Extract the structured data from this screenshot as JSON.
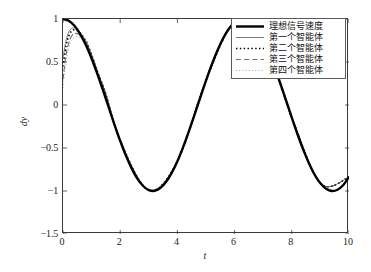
{
  "chart_data": {
    "type": "line",
    "title": "",
    "xlabel": "t",
    "ylabel": "dy",
    "xlim": [
      0,
      10
    ],
    "ylim": [
      -1.5,
      1
    ],
    "xticks": [
      "0",
      "2",
      "4",
      "6",
      "8",
      "10"
    ],
    "xtick_values": [
      0,
      2,
      4,
      6,
      8,
      10
    ],
    "yticks": [
      "1",
      "0.5",
      "0",
      "-0.5",
      "-1",
      "-1.5"
    ],
    "ytick_values": [
      1,
      0.5,
      0,
      -0.5,
      -1,
      -1.5
    ],
    "grid": false,
    "legend_position": "top-right",
    "series": [
      {
        "name": "理想信号速度",
        "style": "solid",
        "width": 2.4,
        "color": "#000000",
        "x": [
          0,
          0.2,
          0.4,
          0.6,
          0.8,
          1,
          1.2,
          1.4,
          1.6,
          1.8,
          2,
          2.2,
          2.4,
          2.6,
          2.8,
          3,
          3.2,
          3.4,
          3.6,
          3.8,
          4,
          4.2,
          4.4,
          4.6,
          4.8,
          5,
          5.2,
          5.4,
          5.6,
          5.8,
          6,
          6.2,
          6.4,
          6.6,
          6.8,
          7,
          7.2,
          7.4,
          7.6,
          7.8,
          8,
          8.2,
          8.4,
          8.6,
          8.8,
          9,
          9.2,
          9.4,
          9.6,
          9.8,
          10
        ],
        "y": [
          1,
          0.98,
          0.921,
          0.825,
          0.697,
          0.54,
          0.362,
          0.17,
          -0.029,
          -0.227,
          -0.416,
          -0.589,
          -0.737,
          -0.857,
          -0.942,
          -0.99,
          -0.998,
          -0.967,
          -0.897,
          -0.791,
          -0.654,
          -0.49,
          -0.307,
          -0.112,
          0.087,
          0.284,
          0.469,
          0.635,
          0.776,
          0.886,
          0.96,
          0.997,
          0.993,
          0.95,
          0.869,
          0.754,
          0.608,
          0.438,
          0.251,
          0.055,
          -0.146,
          -0.34,
          -0.519,
          -0.677,
          -0.811,
          -0.911,
          -0.975,
          -1,
          -0.985,
          -0.93,
          -0.839
        ]
      },
      {
        "name": "第一个智能体",
        "style": "thin-solid",
        "width": 0.8,
        "color": "#5a5a5a",
        "initial_value": 0.55,
        "x": [
          0,
          0.1,
          0.2,
          0.3,
          0.4,
          0.5,
          0.6,
          0.8,
          1,
          1.2,
          1.5,
          2,
          3,
          4,
          5,
          6,
          7,
          8,
          9,
          10
        ],
        "y": [
          0.55,
          0.74,
          0.85,
          0.89,
          0.895,
          0.875,
          0.84,
          0.745,
          0.585,
          0.392,
          0.125,
          -0.416,
          -0.99,
          -0.654,
          0.284,
          0.96,
          0.754,
          -0.146,
          -0.911,
          -0.839
        ]
      },
      {
        "name": "第二个智能体",
        "style": "dotted-bold",
        "width": 1.6,
        "color": "#000000",
        "initial_value": 0.45,
        "x": [
          0,
          0.1,
          0.2,
          0.3,
          0.4,
          0.5,
          0.6,
          0.8,
          1,
          1.2,
          1.5,
          2,
          3,
          4,
          5,
          6,
          7,
          8,
          9,
          10
        ],
        "y": [
          0.45,
          0.68,
          0.8,
          0.86,
          0.875,
          0.865,
          0.835,
          0.745,
          0.585,
          0.392,
          0.125,
          -0.416,
          -0.99,
          -0.654,
          0.284,
          0.96,
          0.754,
          -0.146,
          -0.911,
          -0.839
        ]
      },
      {
        "name": "第三个智能体",
        "style": "dashed",
        "width": 1.1,
        "color": "#6e6e6e",
        "initial_value": 0.3,
        "x": [
          0,
          0.1,
          0.2,
          0.3,
          0.4,
          0.5,
          0.6,
          0.8,
          1,
          1.2,
          1.5,
          2,
          3,
          4,
          5,
          6,
          7,
          8,
          9,
          10
        ],
        "y": [
          0.3,
          0.57,
          0.72,
          0.8,
          0.83,
          0.83,
          0.81,
          0.73,
          0.578,
          0.389,
          0.124,
          -0.417,
          -0.99,
          -0.654,
          0.284,
          0.96,
          0.754,
          -0.146,
          -0.911,
          -0.839
        ]
      },
      {
        "name": "第四个智能体",
        "style": "dotted-fine",
        "width": 0.9,
        "color": "#9a9a9a",
        "initial_value": 0.2,
        "x": [
          0,
          0.1,
          0.2,
          0.3,
          0.4,
          0.5,
          0.6,
          0.8,
          1,
          1.2,
          1.5,
          2,
          3,
          4,
          5,
          6,
          7,
          8,
          9,
          10
        ],
        "y": [
          0.2,
          0.49,
          0.66,
          0.75,
          0.79,
          0.795,
          0.785,
          0.715,
          0.57,
          0.385,
          0.122,
          -0.418,
          -0.99,
          -0.654,
          0.284,
          0.96,
          0.754,
          -0.146,
          -0.911,
          -0.839
        ]
      }
    ]
  }
}
